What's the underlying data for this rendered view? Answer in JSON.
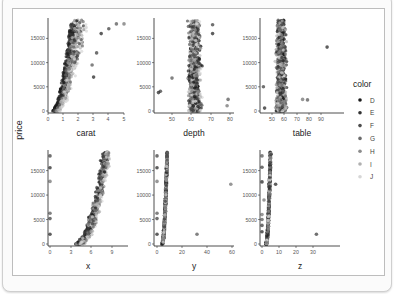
{
  "page": {
    "title_partial": "",
    "frame": "figure-card"
  },
  "legend": {
    "title": "color",
    "items": [
      {
        "label": "D",
        "color": "#1a1a1a"
      },
      {
        "label": "E",
        "color": "#333333"
      },
      {
        "label": "F",
        "color": "#4d4d4d"
      },
      {
        "label": "G",
        "color": "#6b6b6b"
      },
      {
        "label": "H",
        "color": "#8c8c8c"
      },
      {
        "label": "I",
        "color": "#b0b0b0"
      },
      {
        "label": "J",
        "color": "#d6d6d6"
      }
    ]
  },
  "y_label": "price",
  "chart_data": [
    {
      "type": "scatter",
      "xlabel": "carat",
      "ylabel": "price",
      "xticks": [
        "0",
        "1",
        "2",
        "3",
        "4",
        "5"
      ],
      "xlim": [
        0,
        5.1
      ],
      "yticks": [
        "0",
        "5000",
        "10000",
        "15000"
      ],
      "ylim": [
        0,
        18800
      ],
      "series_by": "color",
      "shape": "price rises steeply with carat; dense fan from 0.2-2.5 carat up to ~18800, sparse outliers at 3-5 carat"
    },
    {
      "type": "scatter",
      "xlabel": "depth",
      "ylabel": "price",
      "xticks": [
        "50",
        "60",
        "70",
        "80"
      ],
      "xlim": [
        43,
        79
      ],
      "yticks": [
        "0",
        "5000",
        "10000",
        "15000"
      ],
      "ylim": [
        0,
        18800
      ],
      "shape": "vertical band centered ~62 (55-68), outliers at 43-44 (~4000) and 79 (~1000-2500)"
    },
    {
      "type": "scatter",
      "xlabel": "table",
      "ylabel": "price",
      "xticks": [
        "50",
        "60",
        "70",
        "80",
        "90"
      ],
      "xlim": [
        43,
        95
      ],
      "yticks": [
        "0",
        "5000",
        "10000",
        "15000"
      ],
      "ylim": [
        0,
        18800
      ],
      "shape": "vertical band centered ~57 (50-70), outlier at 95 (~13000), tail to 79 near 2300"
    },
    {
      "type": "scatter",
      "xlabel": "x",
      "ylabel": "price",
      "xticks": [
        "0",
        "3",
        "6",
        "9"
      ],
      "xlim": [
        0,
        10.7
      ],
      "yticks": [
        "0",
        "5000",
        "10000",
        "15000"
      ],
      "ylim": [
        0,
        18800
      ],
      "shape": "curved rising band from x~3.7 (~300) to x~9 (~18800); zero-x outliers at 0 with prices ~2000-18000"
    },
    {
      "type": "scatter",
      "xlabel": "y",
      "ylabel": "price",
      "xticks": [
        "0",
        "20",
        "40",
        "60"
      ],
      "xlim": [
        0,
        59
      ],
      "yticks": [
        "0",
        "5000",
        "10000",
        "15000"
      ],
      "ylim": [
        0,
        18800
      ],
      "shape": "steep narrow band at y 4-10; outliers at 0, ~32 (~2000), ~59 (~12000)"
    },
    {
      "type": "scatter",
      "xlabel": "z",
      "ylabel": "price",
      "xticks": [
        "0",
        "10",
        "20",
        "30"
      ],
      "xlim": [
        0,
        32
      ],
      "yticks": [
        "0",
        "5000",
        "10000",
        "15000"
      ],
      "ylim": [
        0,
        18800
      ],
      "shape": "steep narrow band at z 2-6; outliers at 0, ~8 (~12000), ~32 (~2000)"
    }
  ]
}
